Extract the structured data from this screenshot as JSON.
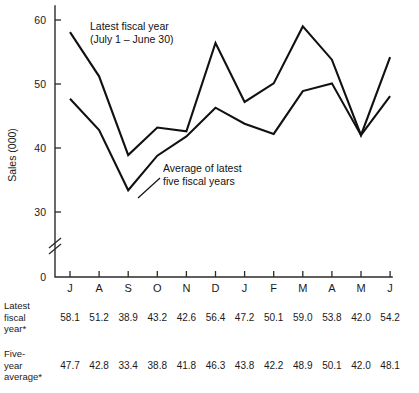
{
  "chart_data": {
    "type": "line",
    "title": "",
    "xlabel": "",
    "ylabel": "Sales (000)",
    "categories": [
      "J",
      "A",
      "S",
      "O",
      "N",
      "D",
      "J",
      "F",
      "M",
      "A",
      "M",
      "J"
    ],
    "ylim": [
      30,
      62
    ],
    "yticks": [
      30,
      40,
      50,
      60
    ],
    "zero_tick": "0",
    "axis_break": true,
    "grid": false,
    "legend": "annotations",
    "series": [
      {
        "name": "Latest fiscal year*",
        "values": [
          58.1,
          51.2,
          38.9,
          43.2,
          42.6,
          56.4,
          47.2,
          50.1,
          59.0,
          53.8,
          42.0,
          54.2
        ]
      },
      {
        "name": "Five-year average*",
        "values": [
          47.7,
          42.8,
          33.4,
          38.8,
          41.8,
          46.3,
          43.8,
          42.2,
          48.9,
          50.1,
          42.0,
          48.1
        ]
      }
    ],
    "annotations": [
      {
        "id": "latest-fiscal-year",
        "line1": "Latest fiscal year",
        "line2": "(July 1 – June 30)"
      },
      {
        "id": "average-latest-five",
        "line1": "Average of latest",
        "line2": "five fiscal years"
      }
    ]
  },
  "table": {
    "rows": [
      {
        "id": "latest-fiscal-year",
        "label_lines": [
          "Latest",
          "fiscal",
          "year*"
        ],
        "values": [
          "58.1",
          "51.2",
          "38.9",
          "43.2",
          "42.6",
          "56.4",
          "47.2",
          "50.1",
          "59.0",
          "53.8",
          "42.0",
          "54.2"
        ]
      },
      {
        "id": "five-year-average",
        "label_lines": [
          "Five-",
          "year",
          "average*"
        ],
        "values": [
          "47.7",
          "42.8",
          "33.4",
          "38.8",
          "41.8",
          "46.3",
          "43.8",
          "42.2",
          "48.9",
          "50.1",
          "42.0",
          "48.1"
        ]
      }
    ]
  }
}
